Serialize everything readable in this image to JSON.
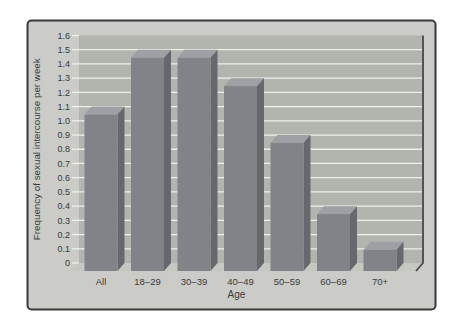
{
  "figure": {
    "xlabel": "Age",
    "ylabel": "Frequency of sexual intercourse per week"
  },
  "chart_data": {
    "type": "bar",
    "style": "3d-bars",
    "title": "",
    "xlabel": "Age",
    "ylabel": "Frequency of sexual intercourse per week",
    "categories": [
      "All",
      "18–29",
      "30–39",
      "40–49",
      "50–59",
      "60–69",
      "70+"
    ],
    "values": [
      1.1,
      1.5,
      1.5,
      1.3,
      0.9,
      0.4,
      0.15
    ],
    "ylim": [
      0,
      1.6
    ],
    "ytick_step": 0.1,
    "ytick_labels": [
      "0",
      "0.1",
      "0.2",
      "0.3",
      "0.4",
      "0.5",
      "0.6",
      "0.7",
      "0.8",
      "0.9",
      "1.0",
      "1.1",
      "1.2",
      "1.3",
      "1.4",
      "1.5",
      "1.6"
    ],
    "grid": true,
    "legend": false
  },
  "colors": {
    "page_bg": "#ffffff",
    "frame_bg": "#cbccc7",
    "frame_border": "#39393b",
    "wall": "#b2b4ae",
    "floor": "#c5c7c1",
    "gridline": "#eef0ea",
    "bar_front": "#808388",
    "bar_side": "#65686d",
    "bar_top": "#9da0a4",
    "axis_edge": "#46484a",
    "text": "#3a3b3d"
  }
}
